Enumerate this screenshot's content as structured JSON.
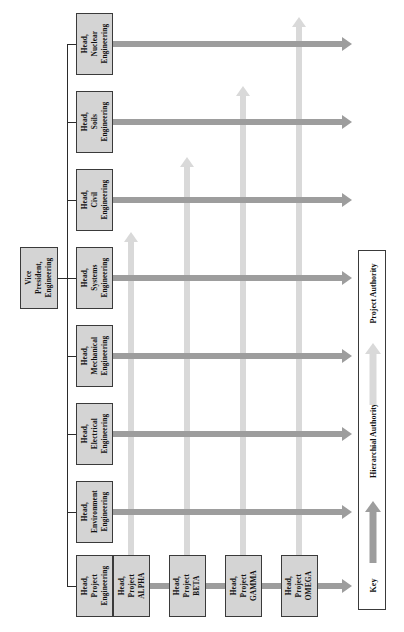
{
  "diagram": {
    "type": "matrix-organization-chart",
    "orientation": "rotated-90-ccw",
    "colors": {
      "box_fill": "#d4d4d4",
      "box_border": "#3a3a3a",
      "hierarchial_authority_arrow": "#9d9d9d",
      "project_authority_arrow": "#d9d9d9",
      "connector_line": "#2b2b2b",
      "background": "#ffffff"
    }
  },
  "executive": {
    "label": "Vice President,\nEngineering",
    "lines": [
      "Vice",
      "President,",
      "Engineering"
    ]
  },
  "functional_departments": [
    {
      "id": "nuclear",
      "lines": [
        "Head,",
        "Nuclear",
        "Engineering"
      ]
    },
    {
      "id": "soils",
      "lines": [
        "Head,",
        "Soils",
        "Engineering"
      ]
    },
    {
      "id": "civil",
      "lines": [
        "Head,",
        "Civil",
        "Engineering"
      ]
    },
    {
      "id": "systems",
      "lines": [
        "Head,",
        "Systems",
        "Engineering"
      ]
    },
    {
      "id": "mechanical",
      "lines": [
        "Head,",
        "Mechanical",
        "Engineering"
      ]
    },
    {
      "id": "electrical",
      "lines": [
        "Head,",
        "Electrical",
        "Engineering"
      ]
    },
    {
      "id": "environment",
      "lines": [
        "Head,",
        "Environment",
        "Engineering"
      ]
    },
    {
      "id": "project-eng",
      "lines": [
        "Head,",
        "Project",
        "Engineering"
      ]
    }
  ],
  "projects": [
    {
      "id": "alpha",
      "lines": [
        "Head,",
        "Project",
        "ALPHA"
      ]
    },
    {
      "id": "beta",
      "lines": [
        "Head,",
        "Project",
        "BETA"
      ]
    },
    {
      "id": "gamma",
      "lines": [
        "Head,",
        "Project",
        "GAMMA"
      ]
    },
    {
      "id": "omega",
      "lines": [
        "Head,",
        "Project",
        "OMEGA"
      ]
    }
  ],
  "key": {
    "title": "Key",
    "hierarchial_authority_label": "Hierarchial Authority",
    "project_authority_label": "Project Authority"
  }
}
